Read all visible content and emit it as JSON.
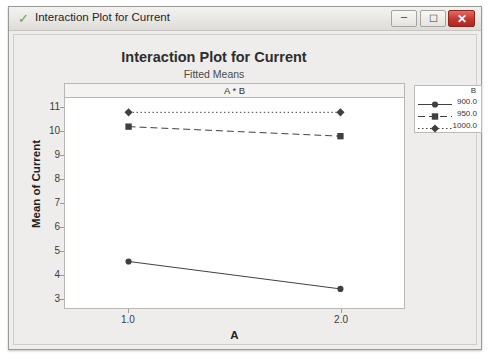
{
  "window": {
    "title": "Interaction Plot for Current",
    "check_icon": "check-icon",
    "buttons": {
      "minimize": "–",
      "maximize": "☐",
      "close": "✕"
    }
  },
  "chart_data": {
    "type": "line",
    "title": "Interaction Plot for Current",
    "subtitle": "Fitted Means",
    "panel_header": "A * B",
    "xlabel": "A",
    "ylabel": "Mean of Current",
    "x": [
      1.0,
      2.0
    ],
    "xtick_labels": [
      "1.0",
      "2.0"
    ],
    "xlim": [
      0.7,
      2.3
    ],
    "ytick_labels": [
      "3",
      "4",
      "5",
      "6",
      "7",
      "8",
      "9",
      "10",
      "11"
    ],
    "ytick_values": [
      3,
      4,
      5,
      6,
      7,
      8,
      9,
      10,
      11
    ],
    "ylim": [
      2.6,
      11.4
    ],
    "grid": false,
    "legend_title": "B",
    "legend_position": "right",
    "series": [
      {
        "name": "900.0",
        "values": [
          4.55,
          3.4
        ],
        "line_style": "solid",
        "marker": "circle",
        "color": "#404040"
      },
      {
        "name": "950.0",
        "values": [
          10.2,
          9.8
        ],
        "line_style": "dashed",
        "marker": "square",
        "color": "#404040"
      },
      {
        "name": "1000.0",
        "values": [
          10.8,
          10.8
        ],
        "line_style": "dashdot",
        "marker": "diamond",
        "color": "#404040"
      }
    ]
  }
}
